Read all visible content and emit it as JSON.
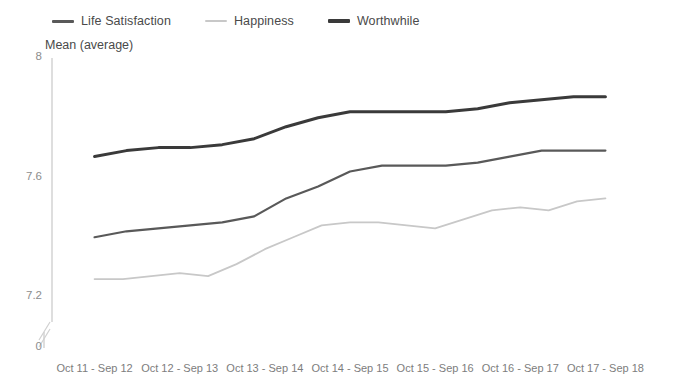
{
  "chart_data": {
    "type": "line",
    "title": "",
    "subtitle": "",
    "xlabel": "",
    "ylabel": "Mean (average)",
    "ylim": [
      7.0,
      8.0
    ],
    "y_ticks": [
      "8",
      "7.6",
      "7.2",
      "0"
    ],
    "y_tick_values": [
      8,
      7.6,
      7.2,
      0
    ],
    "axis_break": true,
    "grid": false,
    "legend_position": "top-left",
    "categories": [
      "Oct 11 - Sep 12",
      "Oct 12 - Sep 13",
      "Oct 13 - Sep 14",
      "Oct 14 - Sep 15",
      "Oct 15 - Sep 16",
      "Oct 16 - Sep 17",
      "Oct 17 - Sep 18"
    ],
    "series": [
      {
        "name": "Life Satisfaction",
        "color": "#595959",
        "values": [
          7.4,
          7.43,
          7.47,
          7.64,
          7.65,
          7.69,
          7.69
        ],
        "detailed_values": [
          7.4,
          7.42,
          7.43,
          7.44,
          7.45,
          7.47,
          7.53,
          7.57,
          7.62,
          7.64,
          7.64,
          7.64,
          7.65,
          7.67,
          7.69,
          7.69,
          7.69
        ]
      },
      {
        "name": "Happiness",
        "color": "#c8c8c8",
        "values": [
          7.26,
          7.27,
          7.35,
          7.45,
          7.43,
          7.49,
          7.53
        ],
        "detailed_values": [
          7.26,
          7.26,
          7.27,
          7.28,
          7.27,
          7.31,
          7.36,
          7.4,
          7.44,
          7.45,
          7.45,
          7.44,
          7.43,
          7.46,
          7.49,
          7.5,
          7.49,
          7.52,
          7.53
        ]
      },
      {
        "name": "Worthwhile",
        "color": "#3a3a3a",
        "values": [
          7.67,
          7.7,
          7.73,
          7.82,
          7.82,
          7.86,
          7.87
        ],
        "detailed_values": [
          7.67,
          7.69,
          7.7,
          7.7,
          7.71,
          7.73,
          7.77,
          7.8,
          7.82,
          7.82,
          7.82,
          7.82,
          7.83,
          7.85,
          7.86,
          7.87,
          7.87
        ]
      }
    ]
  },
  "legend": {
    "items": [
      {
        "label": "Life Satisfaction",
        "color": "#595959",
        "thickness": 3
      },
      {
        "label": "Happiness",
        "color": "#c8c8c8",
        "thickness": 2
      },
      {
        "label": "Worthwhile",
        "color": "#3a3a3a",
        "thickness": 4
      }
    ]
  },
  "axes": {
    "y_title": "Mean (average)",
    "y_labels": [
      "8",
      "7.6",
      "7.2",
      "0"
    ],
    "x_labels": [
      "Oct 11 - Sep 12",
      "Oct 12 - Sep 13",
      "Oct 13 - Sep 14",
      "Oct 14 - Sep 15",
      "Oct 15 - Sep 16",
      "Oct 16 - Sep 17",
      "Oct 17 - Sep 18"
    ]
  },
  "colors": {
    "axis_line": "#d0d0d0",
    "tick_text": "#8d8d8d",
    "background": "#ffffff"
  }
}
